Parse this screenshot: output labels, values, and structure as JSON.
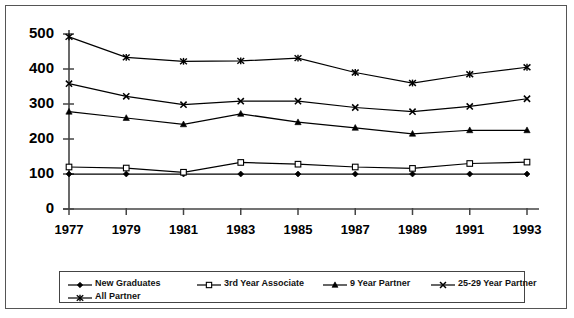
{
  "chart_data": {
    "type": "line",
    "title": "",
    "subtitle": "",
    "xlabel": "",
    "ylabel": "",
    "grid": false,
    "legend_position": "bottom",
    "categories": [
      "1977",
      "1979",
      "1981",
      "1983",
      "1985",
      "1987",
      "1989",
      "1991",
      "1993"
    ],
    "x": [
      1977,
      1979,
      1981,
      1983,
      1985,
      1987,
      1989,
      1991,
      1993
    ],
    "xlim": [
      1977,
      1993
    ],
    "ylim": [
      0,
      500
    ],
    "ytick_labels": [
      "0",
      "100",
      "200",
      "300",
      "400",
      "500"
    ],
    "yticks": [
      0,
      100,
      200,
      300,
      400,
      500
    ],
    "series": [
      {
        "name": "New Graduates",
        "marker": "filled-diamond",
        "values": [
          100,
          100,
          100,
          100,
          100,
          100,
          100,
          100,
          100
        ]
      },
      {
        "name": "3rd Year Associate",
        "marker": "open-square",
        "values": [
          120,
          117,
          105,
          133,
          128,
          120,
          116,
          130,
          134
        ]
      },
      {
        "name": "9 Year Partner",
        "marker": "filled-triangle",
        "values": [
          278,
          260,
          242,
          272,
          248,
          232,
          215,
          225,
          225
        ]
      },
      {
        "name": "25-29 Year Partner",
        "marker": "cross-x",
        "values": [
          358,
          322,
          298,
          308,
          308,
          290,
          278,
          293,
          315
        ]
      },
      {
        "name": "All Partner",
        "marker": "asterisk",
        "values": [
          492,
          433,
          422,
          423,
          431,
          390,
          360,
          385,
          405
        ]
      }
    ],
    "colors": {
      "line": "#000000",
      "axis": "#444444",
      "background": "#ffffff",
      "frame": "#555555"
    }
  },
  "legend": {
    "row1": [
      {
        "label": "New Graduates",
        "marker": "filled-diamond"
      },
      {
        "label": "3rd Year Associate",
        "marker": "open-square"
      },
      {
        "label": "9 Year Partner",
        "marker": "filled-triangle"
      },
      {
        "label": "25-29 Year Partner",
        "marker": "cross-x"
      }
    ],
    "row2": [
      {
        "label": "All Partner",
        "marker": "asterisk"
      }
    ]
  }
}
